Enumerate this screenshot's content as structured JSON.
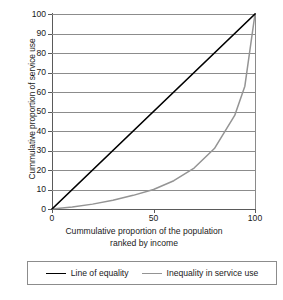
{
  "chart_data": {
    "type": "line",
    "title": "",
    "xlabel": "Cummulative proportion of the population ranked by income",
    "xlabel_line1": "Cummulative proportion of the population",
    "xlabel_line2": "ranked by income",
    "ylabel": "Cummulative proportion of service use",
    "xlim": [
      0,
      100
    ],
    "ylim": [
      0,
      100
    ],
    "xticks": [
      "0",
      "50",
      "100"
    ],
    "xtick_values": [
      0,
      50,
      100
    ],
    "yticks": [
      "0",
      "10",
      "20",
      "30",
      "40",
      "50",
      "60",
      "70",
      "80",
      "90",
      "100"
    ],
    "ytick_values": [
      0,
      10,
      20,
      30,
      40,
      50,
      60,
      70,
      80,
      90,
      100
    ],
    "grid": "horizontal",
    "legend_position": "bottom",
    "series": [
      {
        "name": "Line of equality",
        "color": "#000000",
        "x": [
          0,
          100
        ],
        "values": [
          0,
          100
        ]
      },
      {
        "name": "Inequality in service use",
        "color": "#949494",
        "x": [
          0,
          10,
          20,
          30,
          40,
          50,
          60,
          70,
          80,
          90,
          95,
          100
        ],
        "values": [
          0,
          1,
          2.5,
          4.5,
          7,
          10,
          14.5,
          21,
          31,
          48,
          63,
          100
        ]
      }
    ]
  },
  "legend": {
    "items": [
      {
        "label": "Line of equality",
        "color": "#000000"
      },
      {
        "label": "Inequality in service use",
        "color": "#949494"
      }
    ]
  }
}
